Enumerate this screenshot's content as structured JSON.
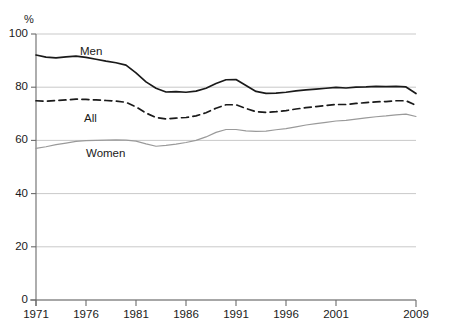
{
  "top_caption": "",
  "axis": {
    "unit_label": "%",
    "y_ticks": [
      "0",
      "20",
      "40",
      "60",
      "80",
      "100"
    ],
    "x_ticks": [
      "1971",
      "1976",
      "1981",
      "1986",
      "1991",
      "1996",
      "2001",
      "2009"
    ]
  },
  "series_labels": {
    "men": "Men",
    "all": "All",
    "women": "Women"
  },
  "colors": {
    "men_line": "#1a1a1a",
    "all_line": "#1a1a1a",
    "women_line": "#9a9a9a",
    "gridline": "#c9c9c9",
    "axis": "#6b6b6b",
    "background": "#ffffff"
  },
  "chart_data": {
    "type": "line",
    "title": "",
    "xlabel": "",
    "ylabel": "%",
    "xlim": [
      1971,
      2009
    ],
    "ylim": [
      0,
      100
    ],
    "grid": true,
    "grid_axis": "y",
    "legend": "inline-labels",
    "x": [
      1971,
      1972,
      1973,
      1974,
      1975,
      1976,
      1977,
      1978,
      1979,
      1980,
      1981,
      1982,
      1983,
      1984,
      1985,
      1986,
      1987,
      1988,
      1989,
      1990,
      1991,
      1992,
      1993,
      1994,
      1995,
      1996,
      1997,
      1998,
      1999,
      2000,
      2001,
      2002,
      2003,
      2004,
      2005,
      2006,
      2007,
      2008,
      2009
    ],
    "series": [
      {
        "name": "Men",
        "style": "solid",
        "color": "#1a1a1a",
        "values": [
          92.1,
          91.3,
          91.0,
          91.4,
          91.7,
          91.2,
          90.5,
          89.8,
          89.2,
          88.3,
          85.4,
          82.0,
          79.6,
          78.2,
          78.3,
          78.1,
          78.5,
          79.6,
          81.4,
          82.8,
          82.9,
          80.6,
          78.4,
          77.7,
          77.8,
          78.1,
          78.6,
          79.0,
          79.3,
          79.6,
          79.9,
          79.7,
          80.0,
          80.1,
          80.3,
          80.2,
          80.3,
          80.1,
          77.6
        ]
      },
      {
        "name": "All",
        "style": "dashed",
        "color": "#1a1a1a",
        "values": [
          74.9,
          74.7,
          75.0,
          75.2,
          75.5,
          75.4,
          75.2,
          75.0,
          74.8,
          74.3,
          72.6,
          70.3,
          68.6,
          68.1,
          68.4,
          68.6,
          69.2,
          70.4,
          72.1,
          73.4,
          73.4,
          72.0,
          70.8,
          70.5,
          70.8,
          71.2,
          71.8,
          72.3,
          72.7,
          73.1,
          73.5,
          73.5,
          73.9,
          74.2,
          74.5,
          74.6,
          74.9,
          74.9,
          73.2
        ]
      },
      {
        "name": "Women",
        "style": "solid",
        "color": "#9a9a9a",
        "values": [
          57.0,
          57.6,
          58.4,
          59.0,
          59.6,
          59.9,
          60.0,
          60.1,
          60.2,
          60.1,
          59.7,
          58.7,
          57.8,
          58.1,
          58.6,
          59.2,
          60.0,
          61.3,
          63.0,
          64.1,
          64.1,
          63.6,
          63.4,
          63.5,
          64.0,
          64.4,
          65.1,
          65.8,
          66.3,
          66.8,
          67.3,
          67.5,
          68.0,
          68.5,
          68.9,
          69.2,
          69.6,
          69.9,
          69.0
        ]
      }
    ]
  }
}
